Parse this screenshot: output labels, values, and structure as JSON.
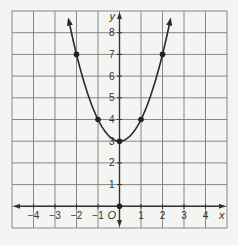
{
  "chart_data": {
    "type": "line",
    "title": "",
    "xlabel": "x",
    "ylabel": "y",
    "origin_label": "O",
    "xlim": [
      -5,
      5
    ],
    "ylim": [
      -1,
      9
    ],
    "grid": true,
    "x_ticks": [
      -4,
      -3,
      -2,
      -1,
      1,
      2,
      3,
      4
    ],
    "y_ticks": [
      1,
      2,
      3,
      4,
      5,
      6,
      7,
      8
    ],
    "x_tick_labels": [
      "−4",
      "−3",
      "−2",
      "−1",
      "1",
      "2",
      "3",
      "4"
    ],
    "y_tick_labels": [
      "1",
      "2",
      "3",
      "4",
      "5",
      "6",
      "7",
      "8"
    ],
    "function": "y = x^2 + 3",
    "series": [
      {
        "name": "parabola",
        "points": [
          {
            "x": -2,
            "y": 7
          },
          {
            "x": -1,
            "y": 4
          },
          {
            "x": 0,
            "y": 3
          },
          {
            "x": 1,
            "y": 4
          },
          {
            "x": 2,
            "y": 7
          }
        ],
        "arrows_at_ends": true
      }
    ],
    "highlighted_points": [
      {
        "x": 0,
        "y": 0
      }
    ],
    "colors": {
      "background": "#f4f4f2",
      "grid": "#7a7a7a",
      "curve": "#2a2a2a"
    }
  }
}
